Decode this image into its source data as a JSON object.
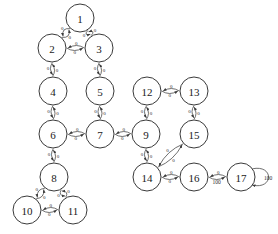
{
  "figure": {
    "type": "directed-graph",
    "background_color": "#ffffff",
    "node_fill": "#ffffff",
    "node_stroke": "#3a3a3a",
    "edge_stroke": "#4a4a4a",
    "node_radius": 14,
    "width": 278,
    "height": 234
  },
  "chart_data": {
    "type": "diagram",
    "title": "",
    "nodes": [
      {
        "id": "1",
        "label": "1",
        "x": 80,
        "y": 18
      },
      {
        "id": "2",
        "label": "2",
        "x": 52,
        "y": 48
      },
      {
        "id": "3",
        "label": "3",
        "x": 99,
        "y": 48
      },
      {
        "id": "4",
        "label": "4",
        "x": 53,
        "y": 91
      },
      {
        "id": "5",
        "label": "5",
        "x": 100,
        "y": 91
      },
      {
        "id": "6",
        "label": "6",
        "x": 53,
        "y": 134
      },
      {
        "id": "7",
        "label": "7",
        "x": 100,
        "y": 134
      },
      {
        "id": "8",
        "label": "8",
        "x": 54,
        "y": 177
      },
      {
        "id": "9",
        "label": "9",
        "x": 146,
        "y": 134
      },
      {
        "id": "10",
        "label": "10",
        "x": 27,
        "y": 210
      },
      {
        "id": "11",
        "label": "11",
        "x": 73,
        "y": 210
      },
      {
        "id": "12",
        "label": "12",
        "x": 147,
        "y": 91
      },
      {
        "id": "13",
        "label": "13",
        "x": 194,
        "y": 91
      },
      {
        "id": "14",
        "label": "14",
        "x": 147,
        "y": 177
      },
      {
        "id": "15",
        "label": "15",
        "x": 194,
        "y": 134
      },
      {
        "id": "16",
        "label": "16",
        "x": 194,
        "y": 177
      },
      {
        "id": "17",
        "label": "17",
        "x": 241,
        "y": 177
      }
    ],
    "edges": [
      {
        "from": "1",
        "to": "2",
        "label": "0",
        "curve": 7
      },
      {
        "from": "2",
        "to": "1",
        "label": "0",
        "curve": 7
      },
      {
        "from": "1",
        "to": "3",
        "label": "0",
        "curve": 7
      },
      {
        "from": "3",
        "to": "1",
        "label": "0",
        "curve": 7
      },
      {
        "from": "2",
        "to": "3",
        "label": "0",
        "curve": 5
      },
      {
        "from": "3",
        "to": "2",
        "label": "0",
        "curve": 5
      },
      {
        "from": "2",
        "to": "4",
        "label": "0",
        "curve": 4
      },
      {
        "from": "4",
        "to": "2",
        "label": "0",
        "curve": 4
      },
      {
        "from": "3",
        "to": "5",
        "label": "0",
        "curve": 4
      },
      {
        "from": "5",
        "to": "3",
        "label": "0",
        "curve": 4
      },
      {
        "from": "4",
        "to": "6",
        "label": "0",
        "curve": 4
      },
      {
        "from": "6",
        "to": "4",
        "label": "0",
        "curve": 4
      },
      {
        "from": "5",
        "to": "7",
        "label": "0",
        "curve": 4
      },
      {
        "from": "7",
        "to": "5",
        "label": "0",
        "curve": 4
      },
      {
        "from": "6",
        "to": "7",
        "label": "0",
        "curve": 5
      },
      {
        "from": "7",
        "to": "6",
        "label": "0",
        "curve": 5
      },
      {
        "from": "6",
        "to": "8",
        "label": "0",
        "curve": 4
      },
      {
        "from": "8",
        "to": "6",
        "label": "0",
        "curve": 4
      },
      {
        "from": "8",
        "to": "10",
        "label": "0",
        "curve": 6
      },
      {
        "from": "10",
        "to": "8",
        "label": "0",
        "curve": 6
      },
      {
        "from": "8",
        "to": "11",
        "label": "0",
        "curve": 6
      },
      {
        "from": "11",
        "to": "8",
        "label": "0",
        "curve": 6
      },
      {
        "from": "10",
        "to": "11",
        "label": "0",
        "curve": 5
      },
      {
        "from": "11",
        "to": "10",
        "label": "0",
        "curve": 5
      },
      {
        "from": "7",
        "to": "9",
        "label": "0",
        "curve": 5
      },
      {
        "from": "9",
        "to": "7",
        "label": "0",
        "curve": 5
      },
      {
        "from": "9",
        "to": "12",
        "label": "0",
        "curve": 4
      },
      {
        "from": "12",
        "to": "9",
        "label": "0",
        "curve": 4
      },
      {
        "from": "12",
        "to": "13",
        "label": "0",
        "curve": 5
      },
      {
        "from": "13",
        "to": "12",
        "label": "0",
        "curve": 5
      },
      {
        "from": "13",
        "to": "15",
        "label": "0",
        "curve": 4
      },
      {
        "from": "15",
        "to": "13",
        "label": "0",
        "curve": 4
      },
      {
        "from": "9",
        "to": "14",
        "label": "0",
        "curve": 4
      },
      {
        "from": "14",
        "to": "9",
        "label": "0",
        "curve": 4
      },
      {
        "from": "15",
        "to": "14",
        "label": "0",
        "curve": 6
      },
      {
        "from": "14",
        "to": "15",
        "label": "0",
        "curve": 6
      },
      {
        "from": "14",
        "to": "16",
        "label": "0",
        "curve": 5
      },
      {
        "from": "16",
        "to": "14",
        "label": "0",
        "curve": 5
      },
      {
        "from": "16",
        "to": "17",
        "label": "100",
        "curve": 5
      },
      {
        "from": "17",
        "to": "16",
        "label": "0",
        "curve": 5
      }
    ],
    "self_loops": [
      {
        "node": "17",
        "label": "100",
        "side": "right"
      }
    ],
    "legend": []
  }
}
